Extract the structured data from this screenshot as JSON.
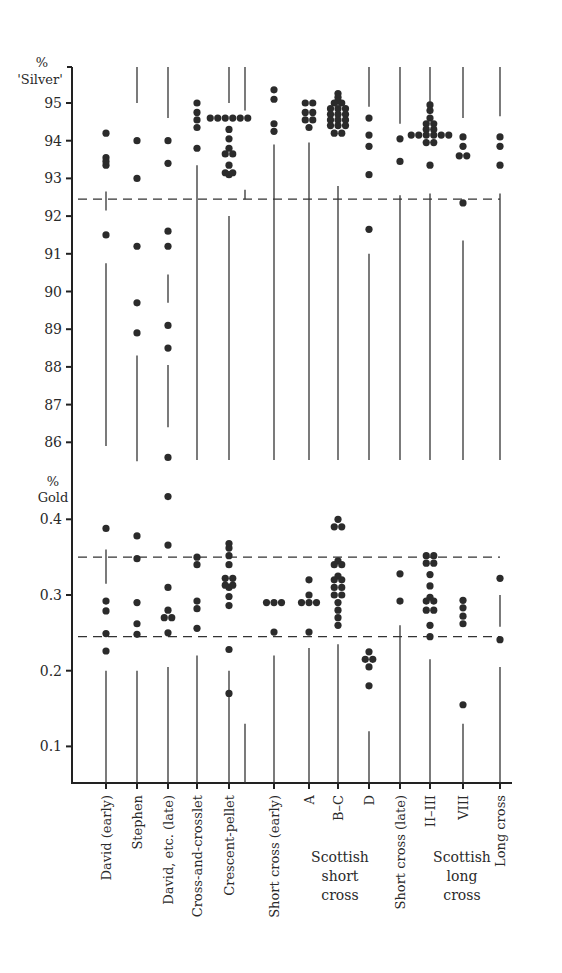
{
  "chart_data": {
    "type": "scatter",
    "title": "",
    "y_axes": [
      {
        "name": "silver",
        "unit": "%",
        "label": "'Silver'",
        "range": [
          85.0,
          95.8
        ],
        "ticks": [
          95,
          94,
          93,
          92,
          91,
          90,
          89,
          88,
          87,
          86
        ]
      },
      {
        "name": "gold",
        "unit": "%",
        "label": "Gold",
        "range": [
          0.05,
          0.45
        ],
        "ticks": [
          0.4,
          0.3,
          0.2,
          0.1
        ],
        "tick_labels": [
          "0.4",
          "0.3",
          "0.2",
          "0.1"
        ]
      }
    ],
    "reference_lines": [
      {
        "axis": "silver",
        "value": 92.45,
        "style": "dashed"
      },
      {
        "axis": "gold",
        "value": 0.35,
        "style": "dashed"
      },
      {
        "axis": "gold",
        "value": 0.245,
        "style": "dashed"
      }
    ],
    "categories": [
      "David (early)",
      "Stephen",
      "David, etc. (late)",
      "Cross-and-crosslet",
      "Crescent-pellet",
      "Short cross (early)",
      "A",
      "B–C",
      "D",
      "Short cross (late)",
      "II–III",
      "VIII",
      "Long cross"
    ],
    "groups": [
      {
        "label_lines": [
          "Scottish",
          "short",
          "cross"
        ],
        "categories": [
          "A",
          "B–C",
          "D"
        ]
      },
      {
        "label_lines": [
          "Scottish",
          "long",
          "cross"
        ],
        "categories": [
          "II–III",
          "VIII"
        ]
      }
    ],
    "series": [
      {
        "category": "David (early)",
        "silver": [
          94.2,
          93.55,
          93.35,
          93.45,
          91.5
        ],
        "gold": [
          0.388,
          0.292,
          0.279,
          0.249,
          0.226
        ]
      },
      {
        "category": "Stephen",
        "silver": [
          94.0,
          93.0,
          91.2,
          89.7,
          88.9
        ],
        "gold": [
          0.378,
          0.348,
          0.29,
          0.262,
          0.248
        ]
      },
      {
        "category": "David, etc. (late)",
        "silver": [
          94.0,
          93.4,
          91.6,
          91.2,
          89.1,
          88.5,
          85.6
        ],
        "gold": [
          0.43,
          0.366,
          0.31,
          0.28,
          0.27,
          0.27,
          0.25
        ]
      },
      {
        "category": "Cross-and-crosslet",
        "silver": [
          95.0,
          94.75,
          94.55,
          94.35,
          93.8
        ],
        "gold": [
          0.35,
          0.34,
          0.292,
          0.282,
          0.256
        ]
      },
      {
        "category": "Crescent-pellet",
        "silver": [
          94.3,
          94.05,
          93.8,
          93.1,
          94.6,
          94.6,
          94.6,
          94.6,
          94.6,
          94.6,
          93.65,
          93.65,
          93.35,
          93.15,
          93.15
        ],
        "gold": [
          0.368,
          0.31,
          0.298,
          0.228,
          0.362,
          0.352,
          0.34,
          0.322,
          0.322,
          0.313,
          0.313,
          0.286,
          0.17
        ]
      },
      {
        "category": "Short cross (early)",
        "silver": [
          95.35,
          95.1,
          94.45,
          94.25
        ],
        "gold": [
          0.29,
          0.29,
          0.29,
          0.251
        ]
      },
      {
        "category": "A",
        "silver": [
          95.0,
          95.0,
          94.75,
          94.75,
          94.55,
          94.55,
          94.35
        ],
        "gold": [
          0.32,
          0.3,
          0.29,
          0.29,
          0.29,
          0.251
        ]
      },
      {
        "category": "B–C",
        "silver": [
          95.25,
          95.15,
          95.05,
          95.0,
          95.0,
          94.85,
          94.85,
          94.85,
          94.7,
          94.7,
          94.7,
          94.55,
          94.55,
          94.55,
          94.4,
          94.4,
          94.4,
          94.2,
          94.2
        ],
        "gold": [
          0.4,
          0.39,
          0.39,
          0.345,
          0.34,
          0.34,
          0.325,
          0.32,
          0.32,
          0.31,
          0.31,
          0.3,
          0.3,
          0.29,
          0.28,
          0.27,
          0.26
        ]
      },
      {
        "category": "D",
        "silver": [
          94.6,
          94.15,
          93.85,
          93.1,
          91.65
        ],
        "gold": [
          0.225,
          0.215,
          0.215,
          0.205,
          0.18
        ]
      },
      {
        "category": "Short cross (late)",
        "silver": [
          94.05,
          93.45
        ],
        "gold": [
          0.328,
          0.292
        ]
      },
      {
        "category": "II–III",
        "silver": [
          94.95,
          94.8,
          94.6,
          94.45,
          94.45,
          94.3,
          94.3,
          94.15,
          94.15,
          94.15,
          94.15,
          94.15,
          94.15,
          93.95,
          93.95,
          93.35
        ],
        "gold": [
          0.352,
          0.352,
          0.342,
          0.342,
          0.327,
          0.312,
          0.297,
          0.292,
          0.292,
          0.28,
          0.28,
          0.26,
          0.245
        ]
      },
      {
        "category": "VIII",
        "silver": [
          94.1,
          93.85,
          93.6,
          93.6,
          92.35
        ],
        "gold": [
          0.293,
          0.283,
          0.272,
          0.262,
          0.155
        ]
      },
      {
        "category": "Long cross",
        "silver": [
          94.1,
          93.85,
          93.35
        ],
        "gold": [
          0.322,
          0.241
        ]
      }
    ],
    "range_lines": [
      {
        "category": "David (early)",
        "segments": [
          [
            0.2,
            0.055
          ],
          [
            90.75,
            85.9
          ],
          [
            92.65,
            92.15
          ],
          [
            0.36,
            0.315
          ]
        ]
      },
      {
        "category": "Stephen",
        "segments": [
          [
            95.8,
            95.0
          ],
          [
            88.3,
            85.5
          ],
          [
            0.2,
            0.055
          ]
        ]
      },
      {
        "category": "David, etc. (late)",
        "segments": [
          [
            95.8,
            94.6
          ],
          [
            90.45,
            89.7
          ],
          [
            88.05,
            86.4
          ],
          [
            0.205,
            0.055
          ]
        ]
      },
      {
        "category": "Cross-and-crosslet",
        "segments": [
          [
            93.35,
            85.0
          ],
          [
            0.22,
            0.055
          ]
        ]
      },
      {
        "category": "Crescent-pellet",
        "segments": [
          [
            95.8,
            95.0
          ],
          [
            92.0,
            85.0
          ],
          [
            0.2,
            0.055
          ]
        ]
      },
      {
        "category": "Crescent-pellet (b)",
        "segments": [
          [
            95.8,
            94.8
          ],
          [
            92.7,
            92.45
          ],
          [
            0.13,
            0.055
          ]
        ]
      },
      {
        "category": "Short cross (early)",
        "segments": [
          [
            93.9,
            85.0
          ],
          [
            0.22,
            0.055
          ]
        ]
      },
      {
        "category": "A",
        "segments": [
          [
            93.95,
            85.0
          ],
          [
            0.23,
            0.055
          ]
        ]
      },
      {
        "category": "B–C",
        "segments": [
          [
            92.8,
            85.0
          ],
          [
            0.235,
            0.055
          ]
        ]
      },
      {
        "category": "D",
        "segments": [
          [
            95.8,
            94.9
          ],
          [
            91.0,
            85.0
          ],
          [
            0.12,
            0.055
          ]
        ]
      },
      {
        "category": "Short cross (late)",
        "segments": [
          [
            95.8,
            94.45
          ],
          [
            92.55,
            85.0
          ],
          [
            0.26,
            0.055
          ]
        ]
      },
      {
        "category": "II–III",
        "segments": [
          [
            95.8,
            94.9
          ],
          [
            92.6,
            85.0
          ],
          [
            0.215,
            0.055
          ]
        ]
      },
      {
        "category": "VIII",
        "segments": [
          [
            95.8,
            94.6
          ],
          [
            91.35,
            85.0
          ],
          [
            0.13,
            0.055
          ]
        ]
      },
      {
        "category": "Long cross",
        "segments": [
          [
            95.8,
            94.65
          ],
          [
            92.6,
            85.0
          ],
          [
            0.3,
            0.258
          ],
          [
            0.205,
            0.055
          ]
        ]
      }
    ],
    "xlabel": "",
    "grid": false,
    "legend": "none"
  }
}
